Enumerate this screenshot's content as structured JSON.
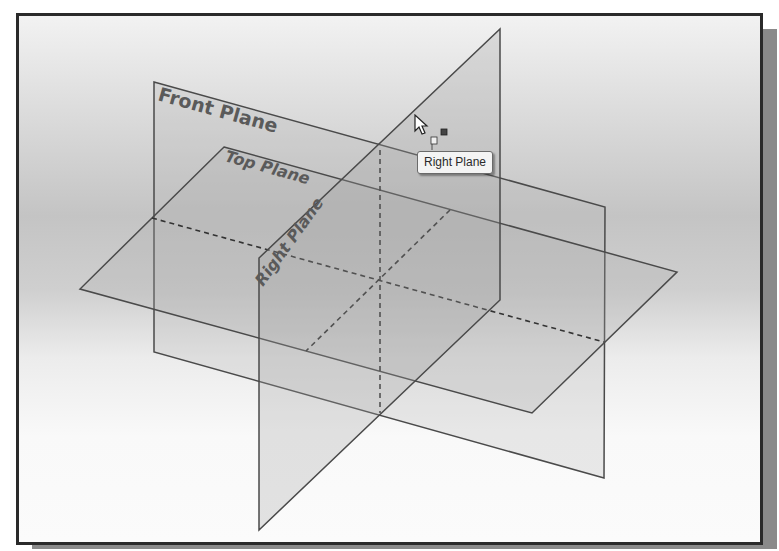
{
  "scene": {
    "planes": [
      {
        "name": "Front Plane",
        "label": "Front Plane"
      },
      {
        "name": "Top Plane",
        "label": "Top Plane"
      },
      {
        "name": "Right Plane",
        "label": "Right Plane"
      }
    ]
  },
  "tooltip": {
    "text": "Right Plane"
  },
  "cursor": {
    "icon": "arrow-cursor-with-plane-select-icon"
  },
  "colors": {
    "plane_edge": "#4a4a4a",
    "label": "#5a5a5a",
    "frame": "#2a2a2a",
    "shadow": "#8a8a8a"
  }
}
